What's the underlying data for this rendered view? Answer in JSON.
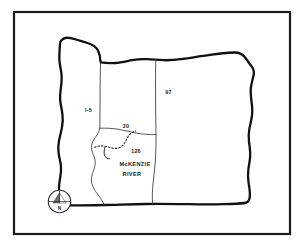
{
  "figure": {
    "kind": "hand-drawn-sketch-map",
    "background_color": "#ffffff",
    "ink_color": "#111111",
    "frame": {
      "present": true,
      "stroke_color": "#1a1a1a"
    }
  },
  "labels": {
    "highway_i5": "I-5",
    "highway_97": "97",
    "highway_20": "20",
    "highway_126": "126",
    "river_line1": "McKENZIE",
    "river_line2": "RIVER"
  },
  "compass": {
    "north_letter": "N",
    "icon": "compass-rose-icon",
    "needle_fill": "#6e6e6e"
  },
  "map_features": [
    {
      "name": "state-outline",
      "type": "boundary",
      "label": ""
    },
    {
      "name": "western-region-divider",
      "type": "internal-line",
      "label": ""
    },
    {
      "name": "central-region-divider",
      "type": "internal-line",
      "label": ""
    },
    {
      "name": "southern-region-divider",
      "type": "internal-line",
      "label": ""
    },
    {
      "name": "mckenzie-river",
      "type": "river",
      "label": "McKENZIE RIVER"
    }
  ]
}
